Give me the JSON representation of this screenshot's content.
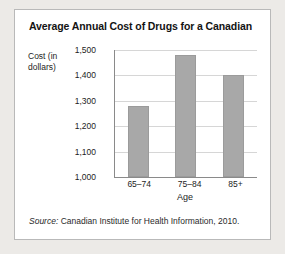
{
  "card": {
    "title": "Average Annual Cost of Drugs for a Canadian",
    "source_lead": "Source:",
    "source_text": " Canadian Institute for Health Information, 2010."
  },
  "chart_data": {
    "type": "bar",
    "title": "Average Annual Cost of Drugs for a Canadian",
    "categories": [
      "65–74",
      "75–84",
      "85+"
    ],
    "values": [
      1280,
      1480,
      1400
    ],
    "series": [
      {
        "name": "Average annual cost of drugs",
        "values": [
          1280,
          1480,
          1400
        ]
      }
    ],
    "xlabel": "Age",
    "ylabel": "Cost (in dollars)",
    "ylim": [
      1000,
      1500
    ],
    "ytick_step": 100,
    "yticks": [
      "1,500",
      "1,400",
      "1,300",
      "1,200",
      "1,100",
      "1,000"
    ],
    "ytick_values": [
      1500,
      1400,
      1300,
      1200,
      1100,
      1000
    ],
    "grid": true,
    "legend": false,
    "bar_color": "#a8a8a8",
    "axis_color": "#8a8a8a",
    "grid_color": "#d6d6d6"
  }
}
